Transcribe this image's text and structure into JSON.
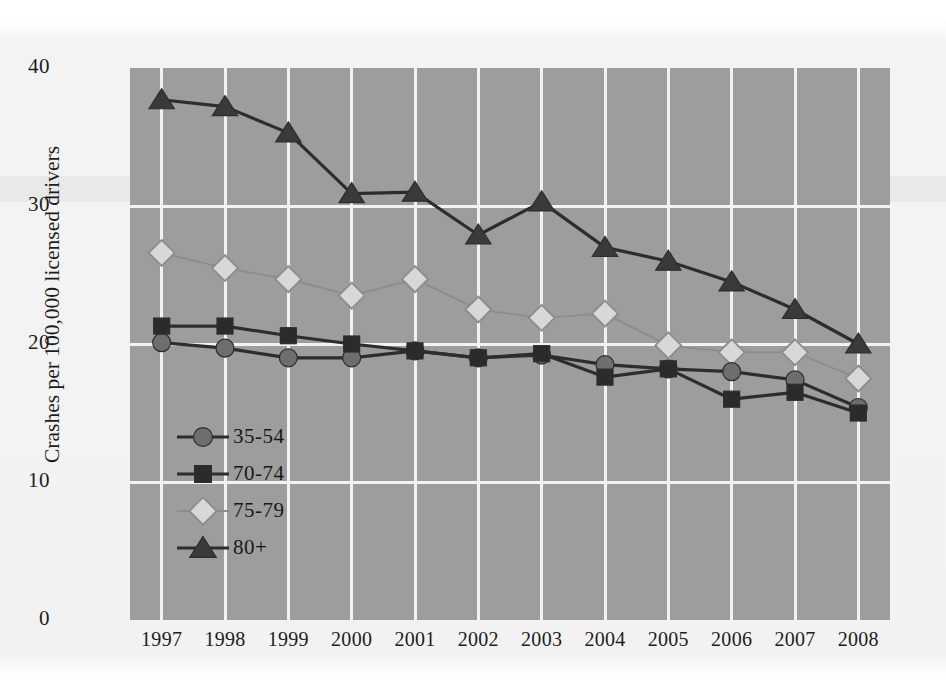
{
  "chart_data": {
    "type": "line",
    "title": "",
    "subtitle": "",
    "xlabel": "",
    "ylabel": "Crashes per 100,000 licensed drivers",
    "categories": [
      "1997",
      "1998",
      "1999",
      "2000",
      "2001",
      "2002",
      "2003",
      "2004",
      "2005",
      "2006",
      "2007",
      "2008"
    ],
    "xtick_labels": [
      "1997",
      "1998",
      "1999",
      "2000",
      "2001",
      "2002",
      "2003",
      "2004",
      "2005",
      "2006",
      "2007",
      "2008"
    ],
    "ytick_labels": [
      "0",
      "10",
      "20",
      "30",
      "40"
    ],
    "ytick_values": [
      0,
      10,
      20,
      30,
      40
    ],
    "ylim": [
      0,
      40
    ],
    "grid": "both",
    "legend_position": "inside-lower-left",
    "plot_background": "#9d9d9d",
    "gridline_color": "#f2f2f2",
    "series": [
      {
        "name": "35-54",
        "marker": "circle",
        "color": "#6e6e6e",
        "line_color": "#2d2d2d",
        "values": [
          20.1,
          19.7,
          19.0,
          19.0,
          19.5,
          19.0,
          19.2,
          18.5,
          18.2,
          18.0,
          17.4,
          15.4
        ]
      },
      {
        "name": "70-74",
        "marker": "square",
        "color": "#2b2b2b",
        "line_color": "#2d2d2d",
        "values": [
          21.3,
          21.3,
          20.6,
          20.0,
          19.5,
          19.0,
          19.3,
          17.6,
          18.2,
          16.0,
          16.5,
          15.0
        ]
      },
      {
        "name": "75-79",
        "marker": "diamond",
        "color": "#d8d8d8",
        "line_color": "#8c8c8c",
        "values": [
          26.6,
          25.5,
          24.7,
          23.5,
          24.7,
          22.5,
          21.9,
          22.2,
          19.9,
          19.4,
          19.4,
          17.5
        ]
      },
      {
        "name": "80+",
        "marker": "triangle",
        "color": "#3a3a3a",
        "line_color": "#2d2d2d",
        "values": [
          37.7,
          37.2,
          35.3,
          30.9,
          31.0,
          27.9,
          30.3,
          27.0,
          26.0,
          24.5,
          22.5,
          20.0
        ]
      }
    ]
  },
  "legend": {
    "items": [
      {
        "label": "35-54"
      },
      {
        "label": "70-74"
      },
      {
        "label": "75-79"
      },
      {
        "label": "80+"
      }
    ]
  }
}
